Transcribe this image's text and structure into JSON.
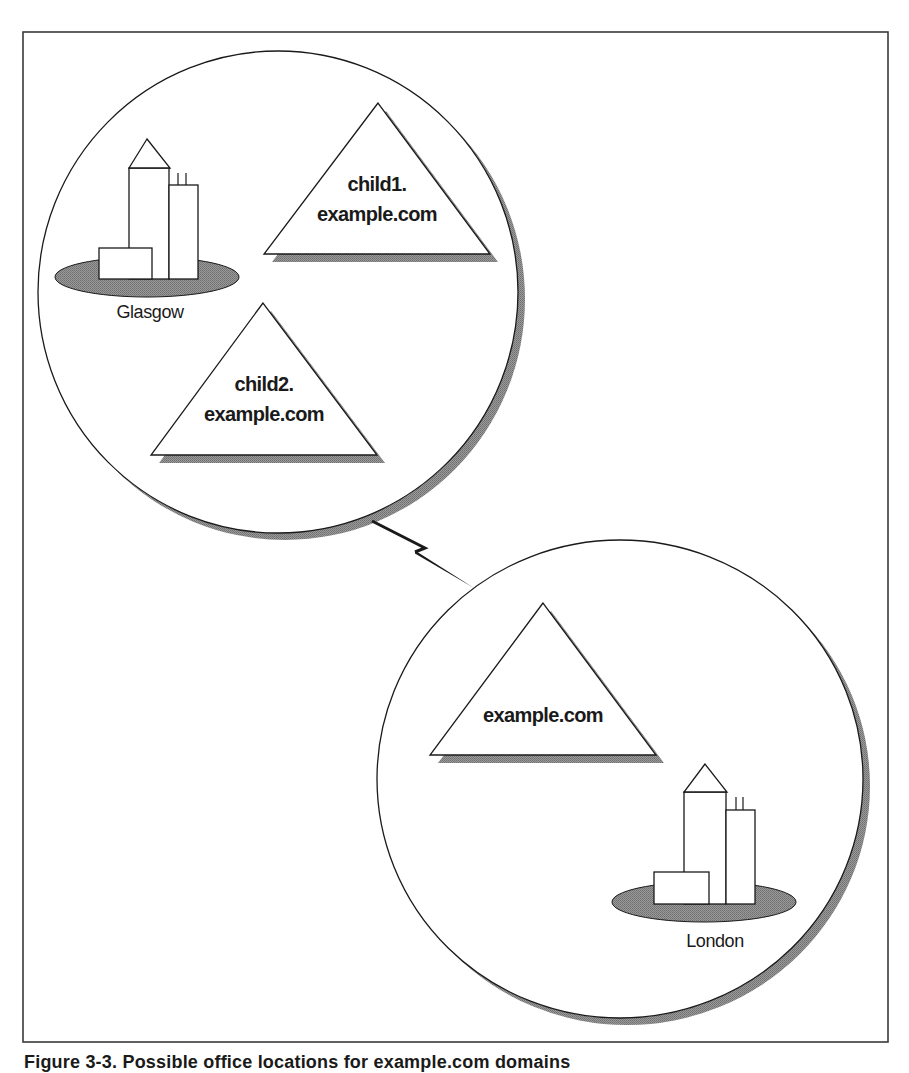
{
  "figure": {
    "frame": {
      "x": 23,
      "y": 32,
      "width": 865,
      "height": 1010,
      "stroke": "#3a3a3a"
    },
    "caption": "Figure 3-3. Possible office locations for example.com domains",
    "colors": {
      "line": "#1a1a1a",
      "shadow": "#8c8c8c",
      "ground": "#8c8c8c",
      "fill": "#ffffff"
    }
  },
  "sites": [
    {
      "id": "glasgow",
      "label": "Glasgow",
      "circle": {
        "cx": 278,
        "cy": 292,
        "rx": 240,
        "ry": 241
      },
      "shadow_offset": 7,
      "building": {
        "ground": {
          "cx": 147,
          "cy": 277,
          "rx": 92,
          "ry": 20
        },
        "roof": [
          [
            147,
            139
          ],
          [
            129,
            168
          ],
          [
            170,
            168
          ]
        ],
        "tall_tower": {
          "x": 129,
          "y": 168,
          "w": 40,
          "h": 111
        },
        "right_tower": {
          "x": 169,
          "y": 185,
          "w": 29,
          "h": 94
        },
        "antennas": [
          [
            178,
            173,
            178,
            185
          ],
          [
            186,
            173,
            186,
            185
          ]
        ],
        "low_block": {
          "x": 99,
          "y": 248,
          "w": 53,
          "h": 31
        }
      },
      "label_pos": {
        "x": 150,
        "y": 318
      }
    },
    {
      "id": "london",
      "label": "London",
      "circle": {
        "cx": 620,
        "cy": 779,
        "rx": 243,
        "ry": 239
      },
      "shadow_offset": 7,
      "building": {
        "ground": {
          "cx": 704,
          "cy": 902,
          "rx": 92,
          "ry": 20
        },
        "roof": [
          [
            705,
            764
          ],
          [
            684,
            792
          ],
          [
            727,
            792
          ]
        ],
        "tall_tower": {
          "x": 684,
          "y": 792,
          "w": 42,
          "h": 112
        },
        "right_tower": {
          "x": 726,
          "y": 810,
          "w": 29,
          "h": 94
        },
        "antennas": [
          [
            736,
            797,
            736,
            810
          ],
          [
            743,
            797,
            743,
            810
          ]
        ],
        "low_block": {
          "x": 654,
          "y": 872,
          "w": 55,
          "h": 32
        }
      },
      "label_pos": {
        "x": 715,
        "y": 947
      }
    }
  ],
  "domains": [
    {
      "id": "child1",
      "lines": [
        "child1.",
        "example.com"
      ],
      "triangle": [
        [
          378,
          103
        ],
        [
          264,
          254
        ],
        [
          490,
          254
        ]
      ],
      "text_x": 377,
      "text_y": [
        191,
        221
      ]
    },
    {
      "id": "child2",
      "lines": [
        "child2.",
        "example.com"
      ],
      "triangle": [
        [
          263,
          303
        ],
        [
          151,
          455
        ],
        [
          377,
          455
        ]
      ],
      "text_x": 264,
      "text_y": [
        391,
        421
      ]
    },
    {
      "id": "root",
      "lines": [
        "example.com"
      ],
      "triangle": [
        [
          543,
          603
        ],
        [
          430,
          755
        ],
        [
          656,
          755
        ]
      ],
      "text_x": 543,
      "text_y": [
        722
      ]
    }
  ],
  "link": {
    "label": "WAN link",
    "points": [
      [
        372,
        521
      ],
      [
        425,
        548
      ],
      [
        415,
        552
      ],
      [
        474,
        588
      ]
    ]
  }
}
